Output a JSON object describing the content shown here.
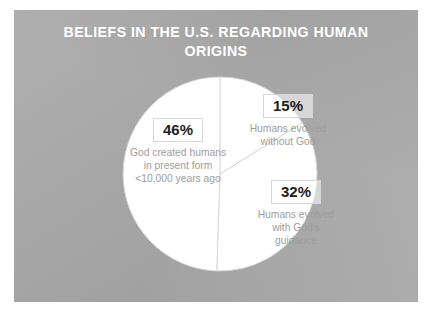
{
  "panel": {
    "background_color": "#a9a9a9"
  },
  "title": {
    "text": "BELIEFS IN THE U.S. REGARDING HUMAN\nORIGINS",
    "color": "#ffffff"
  },
  "chart_data": {
    "type": "pie",
    "title": "BELIEFS IN THE U.S. REGARDING HUMAN ORIGINS",
    "xlabel": "",
    "ylabel": "",
    "legend": "none",
    "grid": false,
    "slice_fill_color": "#ffffff",
    "slice_border_color": "#d9d9d9",
    "percent_text_color": "#1d1d1d",
    "description_text_color": "#9d9d9d",
    "start_angle_deg": 0,
    "direction": "clockwise",
    "categories": [
      "Humans evolved without God",
      "Humans evolved with God's guidance",
      "God created humans in present form <10,000 years ago"
    ],
    "values": [
      15,
      32,
      46
    ],
    "slices": [
      {
        "id": "evolved-without-god",
        "percent": 15,
        "percent_label": "15%",
        "description": "Humans evolved\nwithout God",
        "start_angle_deg": 0,
        "end_angle_deg": 54
      },
      {
        "id": "evolved-with-god",
        "percent": 32,
        "percent_label": "32%",
        "description": "Humans evolved\nwith God's\nguidance",
        "start_angle_deg": 54,
        "end_angle_deg": 169.2
      },
      {
        "id": "created-in-present-form",
        "percent": 46,
        "percent_label": "46%",
        "description": "God created humans\nin present form\n<10,000 years ago",
        "start_angle_deg": 169.2,
        "end_angle_deg": 334.8
      }
    ]
  }
}
